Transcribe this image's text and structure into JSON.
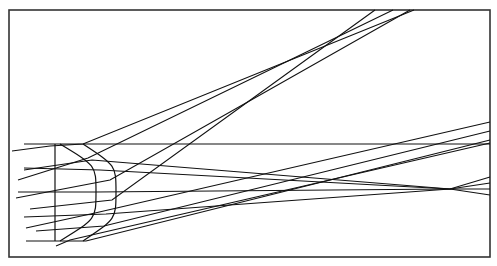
{
  "diagram": {
    "type": "optical-ray-trace",
    "colors": {
      "background": "#ffffff",
      "line": "#111111",
      "frame": "#333333"
    },
    "frame": {
      "x": 9,
      "y": 10,
      "width": 481,
      "height": 247
    },
    "lens": {
      "axis_line": {
        "x": 55,
        "y1": 144,
        "y2": 241
      },
      "inner_arc": {
        "top": [
          60,
          144
        ],
        "apex": [
          96,
          192
        ],
        "bottom": [
          60,
          241
        ]
      },
      "outer_arc": {
        "top": [
          83,
          144
        ],
        "apex": [
          116,
          192
        ],
        "bottom": [
          83,
          241
        ]
      }
    },
    "rays": [
      {
        "id": "h-top",
        "points": [
          [
            24,
            144
          ],
          [
            490,
            144
          ]
        ]
      },
      {
        "id": "h-2",
        "points": [
          [
            24,
            168
          ],
          [
            100,
            170
          ],
          [
            450,
            189
          ],
          [
            490,
            195
          ]
        ]
      },
      {
        "id": "h-3",
        "points": [
          [
            18,
            192
          ],
          [
            96,
            192
          ],
          [
            450,
            189
          ],
          [
            490,
            183
          ]
        ]
      },
      {
        "id": "h-4",
        "points": [
          [
            24,
            217
          ],
          [
            106,
            214
          ],
          [
            450,
            189
          ],
          [
            490,
            177
          ]
        ]
      },
      {
        "id": "h-5",
        "points": [
          [
            26,
            241
          ],
          [
            86,
            241
          ],
          [
            490,
            140
          ]
        ]
      },
      {
        "id": "r-top-1",
        "points": [
          [
            12,
            151
          ],
          [
            50,
            146
          ],
          [
            83,
            144
          ],
          [
            414,
            10
          ]
        ]
      },
      {
        "id": "r-top-2",
        "points": [
          [
            18,
            180
          ],
          [
            88,
            158
          ],
          [
            393,
            10
          ]
        ]
      },
      {
        "id": "r-top-3",
        "points": [
          [
            16,
            198
          ],
          [
            110,
            180
          ],
          [
            410,
            10
          ]
        ]
      },
      {
        "id": "r-top-4",
        "points": [
          [
            30,
            209
          ],
          [
            112,
            200
          ],
          [
            375,
            10
          ]
        ]
      },
      {
        "id": "r-right-1",
        "points": [
          [
            24,
            170
          ],
          [
            92,
            160
          ],
          [
            450,
            189
          ],
          [
            490,
            189
          ]
        ]
      },
      {
        "id": "r-right-2",
        "points": [
          [
            26,
            228
          ],
          [
            95,
            213
          ],
          [
            490,
            122
          ]
        ]
      },
      {
        "id": "r-right-3",
        "points": [
          [
            36,
            231
          ],
          [
            104,
            226
          ],
          [
            490,
            131
          ]
        ]
      },
      {
        "id": "r-right-4",
        "points": [
          [
            56,
            246
          ],
          [
            70,
            240
          ],
          [
            490,
            143
          ]
        ]
      }
    ]
  }
}
